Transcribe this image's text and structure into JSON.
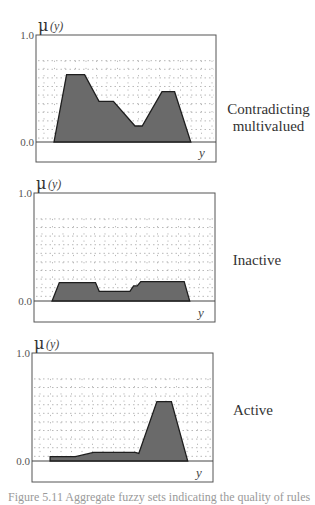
{
  "chart_data": [
    {
      "type": "area",
      "title": "Contradicting multivalued",
      "ylabel": "μ (y)",
      "xlabel": "y",
      "ylim": [
        0.0,
        1.0
      ],
      "y_ticks": [
        "1.0",
        "0.0"
      ],
      "grid": "dotted pattern",
      "x": [
        0.1,
        0.17,
        0.27,
        0.35,
        0.43,
        0.55,
        0.59,
        0.7,
        0.77,
        0.86
      ],
      "values": [
        0.0,
        0.63,
        0.63,
        0.38,
        0.38,
        0.15,
        0.15,
        0.47,
        0.47,
        0.0
      ]
    },
    {
      "type": "area",
      "title": "Inactive",
      "ylabel": "μ (y)",
      "xlabel": "y",
      "ylim": [
        0.0,
        1.0
      ],
      "y_ticks": [
        "1.0",
        "0.0"
      ],
      "grid": "dotted pattern",
      "x": [
        0.1,
        0.14,
        0.34,
        0.36,
        0.53,
        0.55,
        0.57,
        0.59,
        0.83,
        0.86
      ],
      "values": [
        0.0,
        0.17,
        0.17,
        0.09,
        0.09,
        0.14,
        0.14,
        0.18,
        0.18,
        0.0
      ]
    },
    {
      "type": "area",
      "title": "Active",
      "ylabel": "μ (y)",
      "xlabel": "y",
      "ylim": [
        0.0,
        1.0
      ],
      "y_ticks": [
        "1.0",
        "0.0"
      ],
      "grid": "dotted pattern",
      "x": [
        0.1,
        0.1,
        0.24,
        0.34,
        0.57,
        0.59,
        0.69,
        0.77,
        0.86
      ],
      "values": [
        0.0,
        0.04,
        0.04,
        0.08,
        0.08,
        0.07,
        0.55,
        0.55,
        0.0
      ]
    }
  ],
  "labels": {
    "panel1": [
      "Contradicting",
      "multivalued"
    ],
    "panel2": [
      "Inactive"
    ],
    "panel3": [
      "Active"
    ],
    "y_axis": "μ",
    "y_axis_var": "(y)",
    "x_axis": "y",
    "tick_top": "1.0",
    "tick_bottom": "0.0"
  },
  "caption": "Figure 5.11 Aggregate fuzzy sets indicating the quality of rules"
}
